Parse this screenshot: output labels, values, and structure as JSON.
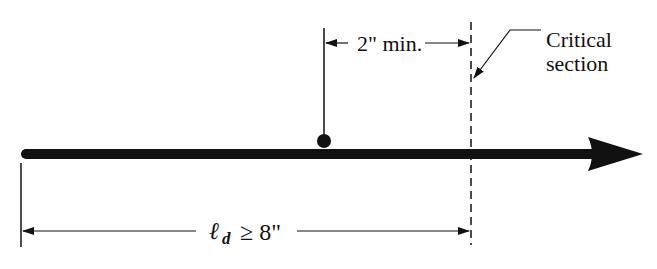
{
  "diagram": {
    "type": "development-length-detail",
    "labels": {
      "min_spacing": "2\" min.",
      "critical_section_line1": "Critical",
      "critical_section_line2": "section",
      "dev_length_symbol": "ℓ",
      "dev_length_subscript": "d",
      "dev_length_relation": "≥ 8\""
    },
    "colors": {
      "ink": "#111111",
      "background": "#ffffff"
    }
  }
}
